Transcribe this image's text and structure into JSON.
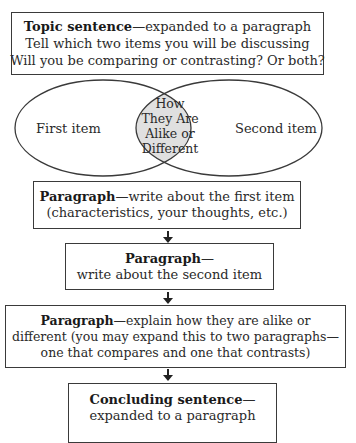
{
  "diagram": {
    "type": "compare-contrast-essay-organizer",
    "topic_box": {
      "bold": "Topic sentence",
      "text": "—expanded to a paragraph",
      "line2": "Tell which two items you will be discussing",
      "line3": "Will you be comparing or contrasting? Or both?"
    },
    "venn": {
      "left_label": "First item",
      "right_label": "Second item",
      "overlap_lines": [
        "How",
        "They Are",
        "Alike or",
        "Different"
      ],
      "overlap_fill": "#e0e0e0"
    },
    "first_paragraph_box": {
      "bold": "Paragraph",
      "text": "—write about the first item",
      "line2": "(characteristics, your thoughts, etc.)"
    },
    "second_paragraph_box": {
      "bold": "Paragraph",
      "text": "—",
      "line2": "write about the second item"
    },
    "alike_paragraph_box": {
      "bold": "Paragraph",
      "text": "—explain how they are alike or",
      "line2": "different (you may expand this to two paragraphs—",
      "line3": "one that compares and one that contrasts)"
    },
    "concluding_box": {
      "bold": "Concluding sentence",
      "text": "—",
      "line2": "expanded to a paragraph"
    },
    "arrows": [
      "down-arrow",
      "down-arrow",
      "down-arrow",
      "down-arrow"
    ],
    "colors": {
      "stroke": "#3a3a3a",
      "text": "#2a2a2a",
      "background": "#ffffff"
    }
  }
}
